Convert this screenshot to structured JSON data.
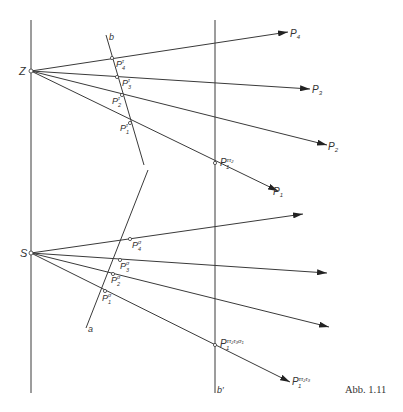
{
  "figure": {
    "caption": "Abb. 1.11",
    "centers": {
      "Z": "Z",
      "S": "S"
    },
    "lines": {
      "b": "b",
      "a": "a",
      "b_prime": "b′"
    },
    "upper_targets": [
      {
        "base": "P",
        "sub": "4"
      },
      {
        "base": "P",
        "sub": "3"
      },
      {
        "base": "P",
        "sub": "2"
      },
      {
        "base": "P",
        "sub": "1"
      }
    ],
    "upper_projections": [
      {
        "base": "P",
        "sub": "4",
        "sup": "τ"
      },
      {
        "base": "P",
        "sub": "3",
        "sup": "τ"
      },
      {
        "base": "P",
        "sub": "2",
        "sup": "τ"
      },
      {
        "base": "P",
        "sub": "1",
        "sup": "τ"
      }
    ],
    "upper_bprime_point": {
      "base": "P",
      "sub": "1",
      "sup": "ττ₂"
    },
    "lower_projections": [
      {
        "base": "P",
        "sub": "4",
        "sup": "σ"
      },
      {
        "base": "P",
        "sub": "3",
        "sup": "σ"
      },
      {
        "base": "P",
        "sub": "2",
        "sup": "σ"
      },
      {
        "base": "P",
        "sub": "1",
        "sup": "σ"
      }
    ],
    "lower_bprime_point": {
      "base": "P",
      "sub": "1",
      "sup": "ττ₂τ₃σ₁"
    },
    "lower_target": {
      "base": "P",
      "sub": "1",
      "sup": "ττ₂τ₃"
    }
  }
}
